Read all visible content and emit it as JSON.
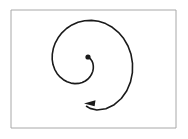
{
  "figure": {
    "type": "spiral-diagram",
    "title": "",
    "caption": "",
    "background_color": "#ffffff",
    "frame": {
      "name": "figure-border",
      "x": 11,
      "y": 10,
      "width": 165,
      "height": 118,
      "stroke_color": "#a8a8a8",
      "stroke_width": 1,
      "fill": "none"
    },
    "spiral": {
      "name": "archimedean-spiral",
      "stroke_color": "#1a1a1a",
      "stroke_width": 1.6,
      "fill": "none",
      "direction": "counterclockwise-outward",
      "turns": 1.6,
      "center_x": 88,
      "center_y": 57,
      "start_radius": 3,
      "end_radius": 46,
      "start_angle_deg": 0,
      "end_angle_deg": 576,
      "path": "M 89.9,58.4 L 91.0,59.6 L 92.1,61.3 L 92.9,63.4 L 93.3,65.8 L 93.3,68.4 L 92.8,71.2 L 91.7,74.0 L 90.1,76.6 L 88.0,79.0 L 85.3,81.0 L 82.2,82.5 L 78.7,83.4 L 74.9,83.6 L 71.0,83.1 L 67.1,81.8 L 63.4,79.7 L 60.0,76.9 L 57.0,73.4 L 54.7,69.3 L 53.0,64.6 L 52.2,59.5 L 52.3,54.1 L 53.3,48.6 L 55.2,43.1 L 58.1,37.8 L 61.9,32.8 L 66.5,28.5 L 71.9,24.9 L 78.0,22.3 L 84.6,20.7 L 91.5,20.4 L 98.6,21.3 L 105.6,23.6 L 112.3,27.3 L 118.4,32.3 L 123.7,38.6 L 128.0,46.0 L 131.0,54.3 L 132.5,63.3 L 132.4,72.6 L 130.5,81.9 L 126.8,90.7 L 121.3,98.5 L 114.2,104.7 L 105.9,108.7 L 96.8,110.0 L 90.0,108.4 L 86.5,106.3"
    },
    "center_dot": {
      "name": "spiral-origin-dot",
      "cx": 88,
      "cy": 57,
      "r": 2.6,
      "fill": "#1a1a1a"
    },
    "arrowhead": {
      "name": "spiral-direction-arrowhead",
      "tip_x": 84,
      "tip_y": 103.4,
      "points": "84,103.4 95.5,100.2 94.6,106.2",
      "fill": "#1a1a1a",
      "direction": "left"
    }
  }
}
